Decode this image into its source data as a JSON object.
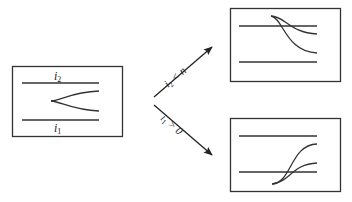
{
  "diagram": {
    "initial_state": {
      "upper_line_label": "i",
      "upper_line_sub": "2",
      "lower_line_label": "i",
      "lower_line_sub": "1"
    },
    "transitions": [
      {
        "condition_var": "i",
        "condition_sub": "2",
        "condition_rest": " < n",
        "target": "upper-shift"
      },
      {
        "condition_var": "i",
        "condition_sub": "1",
        "condition_rest": " > 0",
        "target": "lower-shift"
      }
    ],
    "colors": {
      "stroke": "#333333",
      "background": "#ffffff"
    }
  }
}
